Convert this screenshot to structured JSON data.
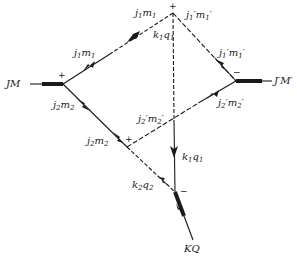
{
  "diagram": {
    "type": "angular-momentum-coupling-graph",
    "external_lines": {
      "left": "JM",
      "right": "J'M'",
      "bottom": "KQ"
    },
    "edges": [
      {
        "id": "j1m1_left",
        "label": "j₁m₁",
        "style": "dashed-solid"
      },
      {
        "id": "j1m1_top",
        "label": "j₁m₁",
        "style": "solid"
      },
      {
        "id": "j1pm1p_top",
        "label": "j₁′m₁′",
        "style": "dashed"
      },
      {
        "id": "j1pm1p_right",
        "label": "j₁′m₁′",
        "style": "solid"
      },
      {
        "id": "j2pm2p_right",
        "label": "j₂′m₂′",
        "style": "solid"
      },
      {
        "id": "j2pm2p_mid",
        "label": "j₂′m₂′",
        "style": "dashed"
      },
      {
        "id": "j2m2_left",
        "label": "j₂m₂",
        "style": "solid"
      },
      {
        "id": "j2m2_mid",
        "label": "j₂m₂",
        "style": "solid"
      },
      {
        "id": "k1q1_top",
        "label": "k₁q₁",
        "style": "dashed"
      },
      {
        "id": "k1q1_bottom",
        "label": "k₁q₁",
        "style": "solid"
      },
      {
        "id": "k2q2",
        "label": "k₂q₂",
        "style": "dashed"
      }
    ],
    "vertex_signs": {
      "top": "+",
      "left": "+",
      "right": "−",
      "middle": "+",
      "bottom": "−"
    },
    "labels": {
      "JM": "JM",
      "JpMp": "J′M′",
      "KQ": "KQ",
      "j1m1_top": {
        "j": "j",
        "sub1": "1",
        "m": "m",
        "sub2": "1"
      },
      "j1m1_left": {
        "j": "j",
        "sub1": "1",
        "m": "m",
        "sub2": "1"
      },
      "j1pm1p_top": {
        "j": "j",
        "sub1": "1",
        "prime": "′",
        "m": "m",
        "sub2": "1"
      },
      "j1pm1p_right": {
        "j": "j",
        "sub1": "1",
        "prime": "′",
        "m": "m",
        "sub2": "1"
      },
      "j2pm2p_right": {
        "j": "j",
        "sub1": "2",
        "prime": "′",
        "m": "m",
        "sub2": "2"
      },
      "j2pm2p_mid": {
        "j": "j",
        "sub1": "2",
        "prime": "′",
        "m": "m",
        "sub2": "2"
      },
      "j2m2_left": {
        "j": "j",
        "sub1": "2",
        "m": "m",
        "sub2": "2"
      },
      "j2m2_mid": {
        "j": "j",
        "sub1": "2",
        "m": "m",
        "sub2": "2"
      },
      "k1q1_top": {
        "k": "k",
        "sub1": "1",
        "q": "q",
        "sub2": "1"
      },
      "k1q1_bottom": {
        "k": "k",
        "sub1": "1",
        "q": "q",
        "sub2": "1"
      },
      "k2q2": {
        "k": "k",
        "sub1": "2",
        "q": "q",
        "sub2": "2"
      }
    },
    "colors": {
      "ink": "#1a1a1a",
      "background": "#ffffff"
    }
  }
}
